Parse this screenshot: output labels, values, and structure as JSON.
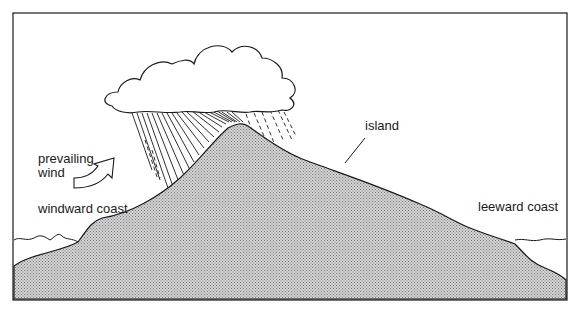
{
  "diagram": {
    "labels": {
      "prevailing_wind_line1": "prevailing",
      "prevailing_wind_line2": "wind",
      "windward_coast": "windward coast",
      "leeward_coast": "leeward coast",
      "island": "island"
    },
    "elements": [
      "cloud",
      "rain",
      "island",
      "sea",
      "wind-arrow",
      "frame"
    ],
    "colors": {
      "line": "#1a1a1a",
      "island_fill": "#b8b8b8",
      "background": "#ffffff"
    }
  }
}
